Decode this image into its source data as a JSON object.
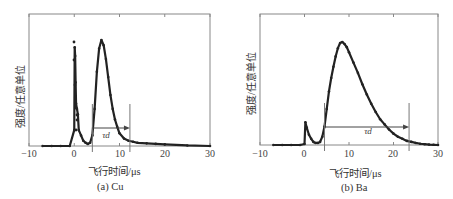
{
  "chart_data": [
    {
      "type": "scatter",
      "caption": "(a) Cu",
      "title": "",
      "xlabel": "飞行时间/μs",
      "ylabel": "强度/任意单位",
      "xlim": [
        -10,
        30
      ],
      "xticks": [
        -10,
        0,
        10,
        20,
        30
      ],
      "ylim": [
        0,
        1
      ],
      "grid": false,
      "annotation": {
        "label": "τd",
        "from": 4,
        "to": 12.3
      },
      "series": [
        {
          "name": "Cu TOF signal",
          "x": [
            -7,
            -5,
            -3,
            -1,
            0,
            0.1,
            0.2,
            0.3,
            0.4,
            0.6,
            0.8,
            1,
            1.5,
            2,
            2.5,
            3,
            3.5,
            4,
            4.5,
            5,
            5.5,
            6,
            6.5,
            7,
            7.5,
            8,
            8.5,
            9,
            9.5,
            10,
            11,
            12,
            13,
            14,
            16,
            18,
            20,
            25,
            30
          ],
          "y": [
            0.0,
            0.0,
            0.0,
            0.0,
            0.15,
            0.93,
            0.85,
            0.6,
            0.4,
            0.35,
            0.3,
            0.15,
            0.1,
            0.05,
            0.03,
            0.02,
            0.03,
            0.1,
            0.35,
            0.7,
            0.92,
            1.0,
            0.95,
            0.82,
            0.65,
            0.48,
            0.35,
            0.25,
            0.18,
            0.12,
            0.07,
            0.05,
            0.04,
            0.03,
            0.025,
            0.02,
            0.015,
            0.005,
            0.0
          ]
        }
      ]
    },
    {
      "type": "scatter",
      "caption": "(b)  Ba",
      "title": "",
      "xlabel": "飞行时间/μs",
      "ylabel": "强度/任意单位",
      "xlim": [
        -10,
        30
      ],
      "xticks": [
        -10,
        0,
        10,
        20,
        30
      ],
      "ylim": [
        0,
        1
      ],
      "grid": false,
      "annotation": {
        "label": "τd",
        "from": 4.5,
        "to": 23.5
      },
      "series": [
        {
          "name": "Ba TOF signal",
          "x": [
            -7,
            -5,
            -3,
            -1,
            0,
            0.2,
            0.5,
            1,
            1.5,
            2,
            2.5,
            3,
            3.5,
            4,
            4.5,
            5,
            5.5,
            6,
            6.5,
            7,
            7.5,
            8,
            8.5,
            9,
            9.5,
            10,
            11,
            12,
            13,
            14,
            15,
            16,
            17,
            18,
            19,
            20,
            21,
            22,
            23,
            24,
            25,
            26,
            27,
            28,
            29,
            30
          ],
          "y": [
            0.0,
            0.0,
            0.0,
            0.0,
            0.01,
            0.22,
            0.17,
            0.1,
            0.06,
            0.03,
            0.02,
            0.02,
            0.03,
            0.08,
            0.18,
            0.35,
            0.52,
            0.65,
            0.76,
            0.86,
            0.94,
            0.99,
            1.0,
            0.98,
            0.95,
            0.9,
            0.8,
            0.7,
            0.59,
            0.49,
            0.4,
            0.32,
            0.25,
            0.2,
            0.15,
            0.11,
            0.08,
            0.06,
            0.04,
            0.03,
            0.02,
            0.012,
            0.008,
            0.004,
            0.002,
            0.0
          ]
        }
      ]
    }
  ],
  "panels": {
    "a": {
      "caption": "(a) Cu",
      "xlabel": "飞行时间/μs",
      "ylabel": "强度/任意单位",
      "tau": "τd",
      "ticks": [
        "−10",
        "0",
        "10",
        "20",
        "30"
      ]
    },
    "b": {
      "caption": "(b)  Ba",
      "xlabel": "飞行时间/μs",
      "ylabel": "强度/任意单位",
      "tau": "τd",
      "ticks": [
        "−10",
        "0",
        "10",
        "20",
        "30"
      ]
    }
  }
}
